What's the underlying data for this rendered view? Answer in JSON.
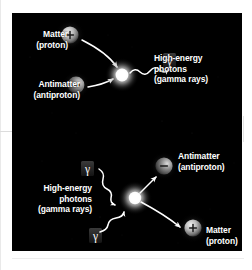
{
  "figure": {
    "background_color": "#000000",
    "text_color": "#ffffff",
    "panels": [
      {
        "name": "annihilation",
        "description": "A proton and an antiproton collide and annihilate, producing high-energy photons."
      },
      {
        "name": "pair-production",
        "description": "High-energy photons collide and produce an antiproton and a proton."
      }
    ]
  },
  "top_panel": {
    "matter": {
      "line1": "Matter",
      "line2": "(proton)",
      "charge_symbol": "+"
    },
    "antimatter": {
      "line1": "Antimatter",
      "line2": "(antiproton)",
      "charge_symbol": "–"
    },
    "photons": {
      "line1": "High-energy",
      "line2": "photons",
      "line3": "(gamma rays)",
      "symbol": "γ"
    }
  },
  "bottom_panel": {
    "photons": {
      "line1": "High-energy",
      "line2": "photons",
      "line3": "(gamma rays)",
      "symbol": "γ"
    },
    "antimatter": {
      "line1": "Antimatter",
      "line2": "(antiproton)",
      "charge_symbol": "–"
    },
    "matter": {
      "line1": "Matter",
      "line2": "(proton)",
      "charge_symbol": "+"
    }
  }
}
